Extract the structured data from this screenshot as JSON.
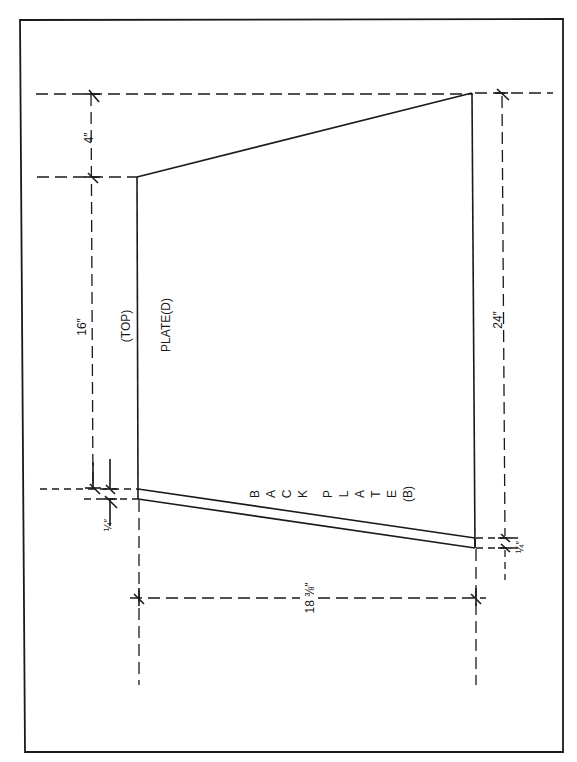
{
  "drawing": {
    "title": "Plate layout drawing",
    "labels": {
      "top": "(TOP)",
      "plate_d": "PLATE(D)",
      "back_plate_letters": [
        "B",
        "A",
        "C",
        "K",
        "",
        "P",
        "L",
        "A",
        "T",
        "E",
        "(B)"
      ]
    },
    "dimensions": {
      "left_upper": "4″",
      "left_main": "16″",
      "left_small": "¼″",
      "bottom_width": "18 ⅜″",
      "right_height": "24″",
      "right_small": "¼″"
    },
    "colors": {
      "line": "#1a1a1a",
      "background": "#ffffff"
    }
  }
}
